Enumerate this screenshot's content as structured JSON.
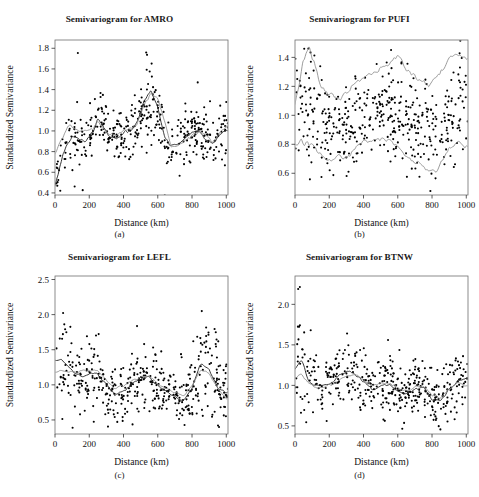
{
  "figure": {
    "panel_count": 4,
    "background_color": "#ffffff",
    "point_color": "#000000",
    "fit_line_color": "#2b2b2b",
    "envelope_line_color": "#8a8a8a"
  },
  "panels": [
    {
      "key": "a",
      "subcaption": "(a)",
      "title": "Semivariogram for AMRO",
      "xlabel": "Distance (km)",
      "ylabel": "Standardized Semivariance",
      "xticks": [
        "0",
        "200",
        "400",
        "600",
        "800",
        "1000"
      ],
      "yticks": [
        "0.4",
        "0.6",
        "0.8",
        "1.0",
        "1.2",
        "1.4",
        "1.6",
        "1.8"
      ]
    },
    {
      "key": "b",
      "subcaption": "(b)",
      "title": "Semivariogram for PUFI",
      "xlabel": "Distance (km)",
      "ylabel": "Standardized Semivariance",
      "xticks": [
        "0",
        "200",
        "400",
        "600",
        "800",
        "1000"
      ],
      "yticks": [
        "0.6",
        "0.8",
        "1.0",
        "1.2",
        "1.4"
      ]
    },
    {
      "key": "c",
      "subcaption": "(c)",
      "title": "Semivariogram for LEFL",
      "xlabel": "Distance (km)",
      "ylabel": "Standardized Semivariance",
      "xticks": [
        "0",
        "200",
        "400",
        "600",
        "800",
        "1000"
      ],
      "yticks": [
        "0.5",
        "1.0",
        "1.5",
        "2.0",
        "2.5"
      ]
    },
    {
      "key": "d",
      "subcaption": "(d)",
      "title": "Semivariogram for BTNW",
      "xlabel": "Distance (km)",
      "ylabel": "Standardized Semivariance",
      "xticks": [
        "0",
        "200",
        "400",
        "600",
        "800",
        "1000"
      ],
      "yticks": [
        "0.5",
        "1.0",
        "1.5",
        "2.0"
      ]
    }
  ],
  "chart_data": [
    {
      "type": "scatter",
      "panel": "a",
      "title": "Semivariogram for AMRO",
      "xlabel": "Distance (km)",
      "ylabel": "Standardized Semivariance",
      "xlim": [
        0,
        1010
      ],
      "ylim": [
        0.38,
        1.88
      ],
      "xticks": [
        0,
        200,
        400,
        600,
        800,
        1000
      ],
      "yticks": [
        0.4,
        0.6,
        0.8,
        1.0,
        1.2,
        1.4,
        1.6,
        1.8
      ],
      "grid": false,
      "legend": "none",
      "n_points": 430,
      "series": [
        {
          "name": "empirical semivariance",
          "kind": "points",
          "description": "Cloud of standardized semivariance values rising steeply from ~0.45 near 0 km to ~1.0 by 100 km, oscillating around 1.0 with a strong peak cluster (values up to 1.85) near 520-600 km, then settling near 0.85-1.0 beyond 650 km.",
          "trend_x": [
            0,
            25,
            50,
            75,
            100,
            140,
            180,
            220,
            250,
            280,
            320,
            360,
            400,
            440,
            480,
            520,
            560,
            600,
            640,
            680,
            720,
            760,
            800,
            840,
            880,
            920,
            960,
            1000
          ],
          "trend_y": [
            0.46,
            0.62,
            0.78,
            0.88,
            0.95,
            0.93,
            0.9,
            1.0,
            1.12,
            1.05,
            0.95,
            0.93,
            0.98,
            1.0,
            1.08,
            1.3,
            1.38,
            1.25,
            0.95,
            0.85,
            0.88,
            0.93,
            0.97,
            1.0,
            0.92,
            0.88,
            0.95,
            1.0
          ],
          "scatter_sd": 0.13
        },
        {
          "name": "lowess fit (black)",
          "kind": "line",
          "color": "#2b2b2b",
          "x": [
            0,
            25,
            50,
            75,
            100,
            140,
            180,
            220,
            250,
            280,
            320,
            360,
            400,
            440,
            480,
            520,
            560,
            600,
            640,
            680,
            720,
            760,
            800,
            840,
            880,
            920,
            960,
            1000
          ],
          "y": [
            0.46,
            0.62,
            0.78,
            0.88,
            0.95,
            0.93,
            0.9,
            1.0,
            1.12,
            1.05,
            0.95,
            0.93,
            0.98,
            1.0,
            1.08,
            1.3,
            1.38,
            1.25,
            0.95,
            0.85,
            0.88,
            0.93,
            0.97,
            1.0,
            0.92,
            0.88,
            0.95,
            1.0
          ]
        },
        {
          "name": "model fit (gray)",
          "kind": "line",
          "color": "#8a8a8a",
          "x": [
            0,
            25,
            50,
            75,
            100,
            140,
            180,
            220,
            250,
            280,
            320,
            360,
            400,
            440,
            480,
            520,
            560,
            600,
            640,
            680,
            720,
            760,
            800,
            840,
            880,
            920,
            960,
            1000
          ],
          "y": [
            0.78,
            0.88,
            0.96,
            1.05,
            1.06,
            1.0,
            1.0,
            1.02,
            1.08,
            1.02,
            0.97,
            0.96,
            1.0,
            1.02,
            1.06,
            1.24,
            1.36,
            1.3,
            1.08,
            0.84,
            0.85,
            0.9,
            0.95,
            1.0,
            0.95,
            0.9,
            0.97,
            1.04
          ]
        }
      ]
    },
    {
      "type": "scatter",
      "panel": "b",
      "title": "Semivariogram for PUFI",
      "xlabel": "Distance (km)",
      "ylabel": "Standardized Semivariance",
      "xlim": [
        0,
        1010
      ],
      "ylim": [
        0.45,
        1.52
      ],
      "xticks": [
        0,
        200,
        400,
        600,
        800,
        1000
      ],
      "yticks": [
        0.6,
        0.8,
        1.0,
        1.2,
        1.4
      ],
      "grid": false,
      "legend": "none",
      "n_points": 460,
      "series": [
        {
          "name": "empirical semivariance",
          "kind": "points",
          "description": "Dense cloud centered near 1.0 across the whole 0-1000 km range, widest spread (0.5-1.5) near 0-150 km, narrowing around 250-350 km and widening again toward 900-1000 km.",
          "trend_x": [
            0,
            40,
            80,
            120,
            160,
            200,
            250,
            300,
            350,
            400,
            450,
            500,
            550,
            600,
            650,
            700,
            750,
            800,
            850,
            900,
            950,
            1000
          ],
          "trend_y": [
            1.0,
            1.06,
            1.1,
            1.03,
            0.95,
            0.9,
            0.88,
            0.9,
            0.95,
            1.0,
            1.02,
            1.05,
            1.05,
            1.02,
            0.98,
            0.92,
            0.88,
            0.88,
            0.92,
            1.0,
            1.05,
            1.02
          ],
          "scatter_sd": 0.16
        },
        {
          "name": "upper envelope (gray)",
          "kind": "line",
          "color": "#8a8a8a",
          "x": [
            0,
            40,
            80,
            110,
            150,
            200,
            250,
            300,
            340,
            380,
            430,
            480,
            520,
            560,
            600,
            640,
            680,
            720,
            770,
            820,
            860,
            900,
            940,
            980,
            1000
          ],
          "y": [
            1.08,
            1.32,
            1.47,
            1.38,
            1.2,
            1.14,
            1.1,
            1.14,
            1.2,
            1.22,
            1.28,
            1.3,
            1.33,
            1.36,
            1.41,
            1.33,
            1.3,
            1.24,
            1.22,
            1.25,
            1.3,
            1.38,
            1.42,
            1.41,
            1.4
          ]
        },
        {
          "name": "lower envelope (gray)",
          "kind": "line",
          "color": "#8a8a8a",
          "x": [
            0,
            40,
            80,
            110,
            150,
            200,
            250,
            300,
            340,
            380,
            430,
            480,
            520,
            560,
            600,
            640,
            680,
            720,
            770,
            820,
            860,
            900,
            940,
            980,
            1000
          ],
          "y": [
            0.8,
            0.81,
            0.8,
            0.77,
            0.72,
            0.69,
            0.73,
            0.69,
            0.74,
            0.8,
            0.82,
            0.83,
            0.83,
            0.82,
            0.78,
            0.73,
            0.69,
            0.67,
            0.62,
            0.62,
            0.67,
            0.76,
            0.81,
            0.8,
            0.78
          ]
        }
      ]
    },
    {
      "type": "scatter",
      "panel": "c",
      "title": "Semivariogram for LEFL",
      "xlabel": "Distance (km)",
      "ylabel": "Standardized Semivariance",
      "xlim": [
        0,
        1010
      ],
      "ylim": [
        0.3,
        2.55
      ],
      "xticks": [
        0,
        200,
        400,
        600,
        800,
        1000
      ],
      "yticks": [
        0.5,
        1.0,
        1.5,
        2.0,
        2.5
      ],
      "grid": false,
      "legend": "none",
      "n_points": 450,
      "series": [
        {
          "name": "empirical semivariance",
          "kind": "points",
          "description": "Cloud with high values (up to 2.5) at short lags (0-250 km), dipping toward 0.8 near 350 km, a mild rise near 500-550 km, a trough near 750 km and a pronounced rise with outliers near 850-900 km.",
          "trend_x": [
            0,
            40,
            80,
            120,
            160,
            200,
            250,
            300,
            350,
            400,
            450,
            500,
            550,
            600,
            650,
            700,
            750,
            800,
            850,
            900,
            950,
            1000
          ],
          "trend_y": [
            1.35,
            1.35,
            1.25,
            1.16,
            1.12,
            1.15,
            1.16,
            1.0,
            0.85,
            0.92,
            1.02,
            1.1,
            1.1,
            1.0,
            0.92,
            0.83,
            0.78,
            0.95,
            1.3,
            1.22,
            0.95,
            0.9
          ],
          "scatter_sd": 0.2
        },
        {
          "name": "lowess fit (black)",
          "kind": "line",
          "color": "#2b2b2b",
          "x": [
            0,
            40,
            80,
            120,
            160,
            200,
            250,
            300,
            350,
            400,
            450,
            500,
            550,
            600,
            650,
            700,
            750,
            800,
            850,
            900,
            950,
            1000
          ],
          "y": [
            1.35,
            1.35,
            1.25,
            1.16,
            1.12,
            1.15,
            1.16,
            1.0,
            0.85,
            0.92,
            1.02,
            1.1,
            1.1,
            1.0,
            0.92,
            0.83,
            0.78,
            0.95,
            1.3,
            1.22,
            0.95,
            0.9
          ]
        },
        {
          "name": "model fit (gray)",
          "kind": "line",
          "color": "#8a8a8a",
          "x": [
            0,
            40,
            80,
            120,
            160,
            200,
            250,
            300,
            350,
            400,
            450,
            500,
            550,
            600,
            650,
            700,
            750,
            800,
            850,
            900,
            950,
            1000
          ],
          "y": [
            1.18,
            1.2,
            1.18,
            1.18,
            1.2,
            1.21,
            1.2,
            1.05,
            0.95,
            1.0,
            1.06,
            1.12,
            1.12,
            1.02,
            0.95,
            0.88,
            0.85,
            0.98,
            1.22,
            1.15,
            0.95,
            0.82
          ]
        }
      ]
    },
    {
      "type": "scatter",
      "panel": "d",
      "title": "Semivariogram for BTNW",
      "xlabel": "Distance (km)",
      "ylabel": "Standardized Semivariance",
      "xlim": [
        0,
        1010
      ],
      "ylim": [
        0.4,
        2.35
      ],
      "xticks": [
        0,
        200,
        400,
        600,
        800,
        1000
      ],
      "yticks": [
        0.5,
        1.0,
        1.5,
        2.0
      ],
      "grid": false,
      "legend": "none",
      "n_points": 440,
      "series": [
        {
          "name": "empirical semivariance",
          "kind": "points",
          "description": "Cloud centered near 1.0-1.15 with high outliers (up to 2.3) below 60 km, a local rise near 300 km, a trough near 620 km and near 800-860 km, then recovery toward 1.1 at 1000 km.",
          "trend_x": [
            0,
            40,
            80,
            120,
            160,
            200,
            250,
            300,
            350,
            400,
            450,
            500,
            550,
            600,
            650,
            700,
            750,
            800,
            850,
            900,
            950,
            1000
          ],
          "trend_y": [
            1.2,
            1.3,
            1.05,
            1.0,
            1.0,
            1.02,
            1.1,
            1.18,
            1.12,
            1.05,
            0.95,
            1.0,
            1.02,
            0.92,
            0.88,
            0.95,
            0.98,
            0.82,
            0.82,
            0.95,
            1.05,
            1.1
          ],
          "scatter_sd": 0.18
        },
        {
          "name": "lowess fit (black)",
          "kind": "line",
          "color": "#2b2b2b",
          "x": [
            0,
            40,
            80,
            120,
            160,
            200,
            250,
            300,
            350,
            400,
            450,
            500,
            550,
            600,
            650,
            700,
            750,
            800,
            850,
            900,
            950,
            1000
          ],
          "y": [
            1.2,
            1.3,
            1.05,
            1.0,
            1.0,
            1.02,
            1.1,
            1.18,
            1.12,
            1.05,
            0.95,
            1.0,
            1.02,
            0.92,
            0.88,
            0.95,
            0.98,
            0.82,
            0.82,
            0.95,
            1.05,
            1.1
          ]
        },
        {
          "name": "model fit (gray)",
          "kind": "line",
          "color": "#8a8a8a",
          "x": [
            0,
            40,
            80,
            120,
            160,
            200,
            250,
            300,
            350,
            400,
            450,
            500,
            550,
            600,
            650,
            700,
            750,
            800,
            850,
            900,
            950,
            1000
          ],
          "y": [
            1.1,
            1.12,
            1.03,
            0.98,
            0.97,
            1.0,
            1.05,
            1.12,
            1.13,
            1.08,
            1.0,
            1.02,
            1.04,
            0.97,
            0.93,
            0.97,
            1.0,
            0.88,
            0.85,
            0.95,
            1.04,
            1.0
          ]
        }
      ]
    }
  ]
}
